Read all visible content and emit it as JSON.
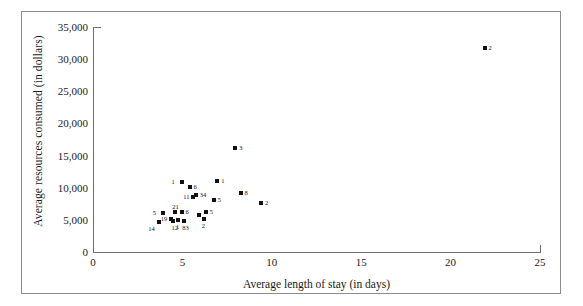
{
  "chart_data": {
    "type": "scatter",
    "title": "",
    "xlabel": "Average length of stay (in days)",
    "ylabel": "Average resources consumed (in dollars)",
    "xlim": [
      0,
      25
    ],
    "ylim": [
      0,
      35000
    ],
    "xticks": [
      "0",
      "5",
      "10",
      "15",
      "20",
      "25"
    ],
    "xtick_values": [
      0,
      5,
      10,
      15,
      20,
      25
    ],
    "yticks": [
      "0",
      "5,000",
      "10,000",
      "15,000",
      "20,000",
      "25,000",
      "30,000",
      "35,000"
    ],
    "ytick_values": [
      0,
      5000,
      10000,
      15000,
      20000,
      25000,
      30000,
      35000
    ],
    "grid": false,
    "legend": false,
    "marker": "square",
    "marker_color": "#111111",
    "points": [
      {
        "x": 3.7,
        "y": 4650,
        "label": "14",
        "label_pos": "left-below"
      },
      {
        "x": 3.9,
        "y": 6050,
        "label": "5",
        "label_pos": "left"
      },
      {
        "x": 4.35,
        "y": 5150,
        "label": "19",
        "label_pos": "left"
      },
      {
        "x": 4.5,
        "y": 4800,
        "label": "12",
        "label_pos": "below"
      },
      {
        "x": 4.6,
        "y": 6200,
        "label": "21",
        "label_pos": "above"
      },
      {
        "x": 4.75,
        "y": 5050,
        "label": "1",
        "label_pos": "below"
      },
      {
        "x": 4.95,
        "y": 6200,
        "label": "6",
        "label_pos": "right"
      },
      {
        "x": 5.1,
        "y": 4800,
        "label": "83",
        "label_pos": "below"
      },
      {
        "x": 4.95,
        "y": 10900,
        "label": "1",
        "label_pos": "left"
      },
      {
        "x": 5.4,
        "y": 10100,
        "label": "6",
        "label_pos": "right"
      },
      {
        "x": 5.6,
        "y": 8550,
        "label": "11",
        "label_pos": "left"
      },
      {
        "x": 5.75,
        "y": 8800,
        "label": "34",
        "label_pos": "right"
      },
      {
        "x": 5.95,
        "y": 5750,
        "label": "",
        "label_pos": "none"
      },
      {
        "x": 6.3,
        "y": 6200,
        "label": "5",
        "label_pos": "right"
      },
      {
        "x": 6.2,
        "y": 5150,
        "label": "2",
        "label_pos": "below"
      },
      {
        "x": 6.75,
        "y": 8150,
        "label": "5",
        "label_pos": "right"
      },
      {
        "x": 6.95,
        "y": 11050,
        "label": "1",
        "label_pos": "right"
      },
      {
        "x": 7.95,
        "y": 16200,
        "label": "3",
        "label_pos": "right"
      },
      {
        "x": 8.25,
        "y": 9200,
        "label": "8",
        "label_pos": "right"
      },
      {
        "x": 9.4,
        "y": 7700,
        "label": "2",
        "label_pos": "right"
      },
      {
        "x": 21.9,
        "y": 31700,
        "label": "2",
        "label_pos": "right"
      }
    ]
  },
  "axis": {
    "x_title": "Average length of stay (in days)",
    "y_title": "Average resources consumed (in dollars)"
  }
}
